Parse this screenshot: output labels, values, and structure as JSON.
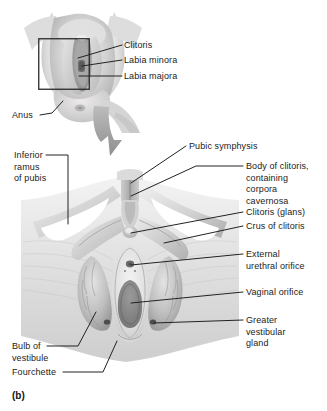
{
  "figure": {
    "panel_letter": "(b)",
    "background_color": "#ffffff",
    "text_color": "#1b1b1b",
    "leader_line_color": "#222222",
    "illustration_style": "grayscale-airbrush-anatomical"
  },
  "top_panel": {
    "name": "perineal-overview",
    "inset_box": {
      "visible": true,
      "stroke_color": "#2a2a2a"
    },
    "labels": [
      {
        "id": "clitoris",
        "text": "Clitoris"
      },
      {
        "id": "labia-minora",
        "text": "Labia minora"
      },
      {
        "id": "labia-majora",
        "text": "Labia majora"
      },
      {
        "id": "anus",
        "text": "Anus"
      }
    ]
  },
  "transition": {
    "arrow": {
      "name": "magnify-arrow",
      "direction": "down",
      "color": "#9a9a9a"
    }
  },
  "bottom_panel": {
    "name": "deep-perineal-dissection",
    "labels_left": [
      {
        "id": "inferior-ramus-of-pubis",
        "text": "Inferior\nramus\nof pubis"
      },
      {
        "id": "bulb-of-vestibule",
        "text": "Bulb of\nvestibule"
      },
      {
        "id": "fourchette",
        "text": "Fourchette"
      }
    ],
    "labels_top": [
      {
        "id": "pubic-symphysis",
        "text": "Pubic symphysis"
      }
    ],
    "labels_right": [
      {
        "id": "body-of-clitoris",
        "text": "Body of clitoris,\ncontaining\ncorpora\ncavernosa"
      },
      {
        "id": "clitoris-glans",
        "text": "Clitoris (glans)"
      },
      {
        "id": "crus-of-clitoris",
        "text": "Crus of clitoris"
      },
      {
        "id": "external-urethral-orifice",
        "text": "External\nurethral orifice"
      },
      {
        "id": "vaginal-orifice",
        "text": "Vaginal orifice"
      },
      {
        "id": "greater-vestibular-gland",
        "text": "Greater\nvestibular\ngland"
      }
    ]
  }
}
